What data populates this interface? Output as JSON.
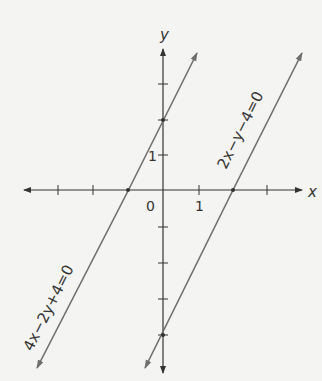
{
  "figure": {
    "axes": {
      "x_label": "x",
      "y_label": "y",
      "origin_label": "0",
      "x_tick_label": "1",
      "y_tick_label": "1",
      "x_ticks": [
        -4,
        -3,
        -1,
        1,
        2,
        3
      ],
      "y_ticks": [
        -4,
        -3,
        -2,
        -1,
        1,
        2,
        3
      ]
    },
    "lines": [
      {
        "equation": "4x−2y+4=0",
        "slope": 2,
        "x_intercept": -1,
        "y_intercept": 2,
        "color": "#6e6e6e"
      },
      {
        "equation": "2x−y−4=0",
        "slope": 2,
        "x_intercept": 2,
        "y_intercept": -4,
        "color": "#6e6e6e"
      }
    ],
    "colors": {
      "background": "#f4f4f2",
      "axis": "#333333",
      "line": "#6e6e6e"
    }
  }
}
